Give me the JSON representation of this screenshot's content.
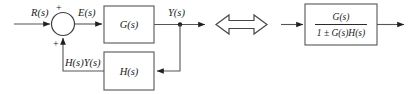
{
  "diagram": {
    "left_diagram": {
      "name": "feedback-loop",
      "input_label": "R(s)",
      "error_label": "E(s)",
      "output_label": "Y(s)",
      "feedback_label": "H(s)Y(s)",
      "summing_junction": {
        "input_sign": "+",
        "feedback_sign": "+"
      },
      "forward_block_label": "G(s)",
      "feedback_block_label": "H(s)"
    },
    "equivalence_symbol": "double-headed-arrow",
    "right_diagram": {
      "name": "reduced-transfer-function",
      "numerator": "G(s)",
      "denominator": "1 ± G(s)H(s)"
    },
    "colors": {
      "line": "#55565a",
      "text": "#1a1a1a",
      "background": "#ffffff"
    }
  }
}
